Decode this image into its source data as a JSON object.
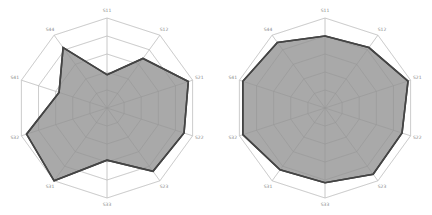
{
  "chart_data": [
    {
      "type": "radar",
      "title": "",
      "categories": [
        "S11",
        "S12",
        "S21",
        "S22",
        "S23",
        "S33",
        "S31",
        "S32",
        "S41",
        "S44"
      ],
      "series": [
        {
          "name": "left",
          "values": [
            0.37,
            0.68,
            0.95,
            0.9,
            0.87,
            0.58,
            1.0,
            0.94,
            0.56,
            0.83
          ]
        }
      ],
      "rlim": [
        0,
        1
      ],
      "grid_rings": 5,
      "fill_color": "#a9a9a9",
      "line_color": "#444444",
      "grid_color": "#dddddd",
      "center": [
        107,
        108
      ],
      "radius": 90
    },
    {
      "type": "radar",
      "title": "",
      "categories": [
        "S11",
        "S12",
        "S21",
        "S22",
        "S23",
        "S33",
        "S31",
        "S32",
        "S41",
        "S44"
      ],
      "series": [
        {
          "name": "right",
          "values": [
            0.8,
            0.83,
            0.97,
            0.9,
            0.91,
            0.83,
            0.85,
            0.96,
            0.96,
            0.9
          ]
        }
      ],
      "rlim": [
        0,
        1
      ],
      "grid_rings": 5,
      "fill_color": "#a9a9a9",
      "line_color": "#444444",
      "grid_color": "#dddddd",
      "center": [
        325,
        108
      ],
      "radius": 90
    }
  ]
}
